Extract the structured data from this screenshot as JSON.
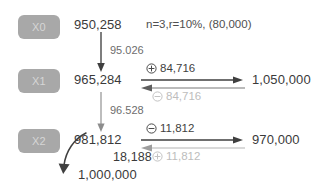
{
  "diagram": {
    "title_note": "n=3,r=10%, (80,000)",
    "steps": [
      {
        "badge": "X0",
        "value": "950,258"
      },
      {
        "badge": "X1",
        "value": "965,284"
      },
      {
        "badge": "X2",
        "value": "981,812"
      }
    ],
    "vertical_deltas": [
      {
        "label": "95.026"
      },
      {
        "label": "96.528"
      }
    ],
    "rows": [
      {
        "from": "965,284",
        "forward_op": "plus-circle",
        "forward_sign": "⊕",
        "forward_amount": "84,716",
        "target": "1,050,000",
        "back_op": "minus-circle",
        "back_sign": "⊖",
        "back_amount": "84,716"
      },
      {
        "from": "981,812",
        "forward_op": "minus-circle",
        "forward_sign": "⊖",
        "forward_amount": "11,812",
        "target": "970,000",
        "back_op": "plus-circle",
        "back_sign": "⊕",
        "back_amount": "11,812"
      }
    ],
    "final": {
      "delta": "18,188",
      "value": "1,000,000"
    },
    "colors": {
      "badge_bg": "#a8a8a8",
      "badge_text": "#d6d6d6",
      "text_dark": "#3a3a3a",
      "text_muted": "#6d6d6d",
      "text_light": "#bdbdbd",
      "arrow_dark": "#3f3f3f",
      "arrow_light": "#bdbdbd"
    }
  }
}
